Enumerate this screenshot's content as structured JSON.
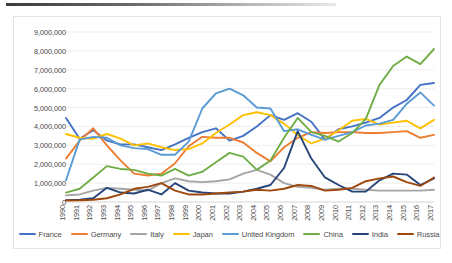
{
  "chart_data": {
    "type": "line",
    "title": "",
    "xlabel": "",
    "ylabel": "",
    "grid": true,
    "legend_position": "bottom",
    "ylim": [
      0,
      9000000
    ],
    "ytick_labels": [
      "9,000,000",
      "8,000,000",
      "7,000,000",
      "6,000,000",
      "5,000,000",
      "4,000,000",
      "3,000,000",
      "2,000,000",
      "1,000,000",
      "0"
    ],
    "ytick_values": [
      9000000,
      8000000,
      7000000,
      6000000,
      5000000,
      4000000,
      3000000,
      2000000,
      1000000,
      0
    ],
    "categories": [
      "1990",
      "1991",
      "1992",
      "1993",
      "1994",
      "1995",
      "1996",
      "1997",
      "1998",
      "1999",
      "2000",
      "2001",
      "2002",
      "2003",
      "2004",
      "2005",
      "2006",
      "2007",
      "2008",
      "2009",
      "2010",
      "2011",
      "2012",
      "2013",
      "2014",
      "2015",
      "2016",
      "2017"
    ],
    "series": [
      {
        "name": "France",
        "color": "#4472C4",
        "values": [
          4450000,
          3350000,
          3800000,
          3250000,
          3050000,
          3050000,
          2900000,
          2750000,
          3050000,
          3400000,
          3700000,
          3900000,
          3250000,
          3500000,
          4000000,
          4600000,
          4350000,
          4700000,
          4250000,
          3300000,
          3850000,
          4000000,
          4200000,
          4450000,
          5000000,
          5400000,
          6200000,
          6300000
        ]
      },
      {
        "name": "Germany",
        "color": "#ED7D31",
        "values": [
          2300000,
          3250000,
          3900000,
          3000000,
          2200000,
          1500000,
          1400000,
          1500000,
          2050000,
          2950000,
          3450000,
          3400000,
          3400000,
          3150000,
          2600000,
          2150000,
          2900000,
          3400000,
          3700000,
          3650000,
          3700000,
          3700000,
          3650000,
          3650000,
          3700000,
          3750000,
          3400000,
          3550000
        ]
      },
      {
        "name": "Italy",
        "color": "#A5A5A5",
        "values": [
          350000,
          400000,
          600000,
          750000,
          700000,
          650000,
          600000,
          1000000,
          1250000,
          1100000,
          1050000,
          1100000,
          1200000,
          1500000,
          1700000,
          1450000,
          1000000,
          800000,
          750000,
          650000,
          700000,
          700000,
          650000,
          600000,
          600000,
          600000,
          600000,
          650000
        ]
      },
      {
        "name": "Japan",
        "color": "#FFC000",
        "values": [
          3600000,
          3400000,
          3350000,
          3600000,
          3350000,
          3000000,
          3100000,
          2900000,
          2750000,
          2800000,
          3100000,
          3650000,
          4100000,
          4600000,
          4750000,
          4600000,
          4150000,
          3550000,
          3100000,
          3350000,
          3800000,
          4300000,
          4400000,
          4100000,
          4200000,
          4300000,
          3900000,
          4350000
        ]
      },
      {
        "name": "United Kingdom",
        "color": "#5B9BD5",
        "values": [
          1150000,
          3300000,
          3450000,
          3400000,
          3000000,
          2850000,
          2800000,
          2500000,
          2500000,
          3200000,
          4950000,
          5750000,
          6000000,
          5650000,
          5000000,
          4950000,
          3750000,
          3850000,
          3550000,
          3300000,
          3500000,
          3700000,
          4050000,
          4150000,
          4350000,
          5200000,
          5800000,
          5100000
        ]
      },
      {
        "name": "China",
        "color": "#70AD47",
        "values": [
          500000,
          700000,
          1300000,
          1900000,
          1750000,
          1700000,
          1500000,
          1400000,
          1750000,
          1400000,
          1600000,
          2100000,
          2600000,
          2400000,
          1700000,
          2200000,
          3400000,
          4450000,
          3700000,
          3500000,
          3200000,
          3650000,
          4400000,
          6200000,
          7200000,
          7700000,
          7300000,
          8100000
        ]
      },
      {
        "name": "India",
        "color": "#264478",
        "values": [
          100000,
          120000,
          200000,
          750000,
          500000,
          450000,
          650000,
          400000,
          1000000,
          600000,
          500000,
          450000,
          450000,
          550000,
          700000,
          900000,
          1800000,
          3750000,
          2300000,
          1300000,
          900000,
          550000,
          550000,
          1150000,
          1500000,
          1450000,
          900000,
          1250000
        ]
      },
      {
        "name": "Russia",
        "color": "#9E480E",
        "values": [
          80000,
          90000,
          120000,
          200000,
          400000,
          700000,
          800000,
          1000000,
          600000,
          400000,
          400000,
          450000,
          500000,
          550000,
          650000,
          600000,
          700000,
          900000,
          850000,
          600000,
          650000,
          750000,
          1100000,
          1250000,
          1350000,
          1050000,
          850000,
          1300000
        ]
      }
    ]
  },
  "legend": {
    "items": [
      {
        "label": "France",
        "color": "#4472C4"
      },
      {
        "label": "Germany",
        "color": "#ED7D31"
      },
      {
        "label": "Italy",
        "color": "#A5A5A5"
      },
      {
        "label": "Japan",
        "color": "#FFC000"
      },
      {
        "label": "United Kingdom",
        "color": "#5B9BD5"
      },
      {
        "label": "China",
        "color": "#70AD47"
      },
      {
        "label": "India",
        "color": "#264478"
      },
      {
        "label": "Russia",
        "color": "#9E480E"
      }
    ]
  }
}
